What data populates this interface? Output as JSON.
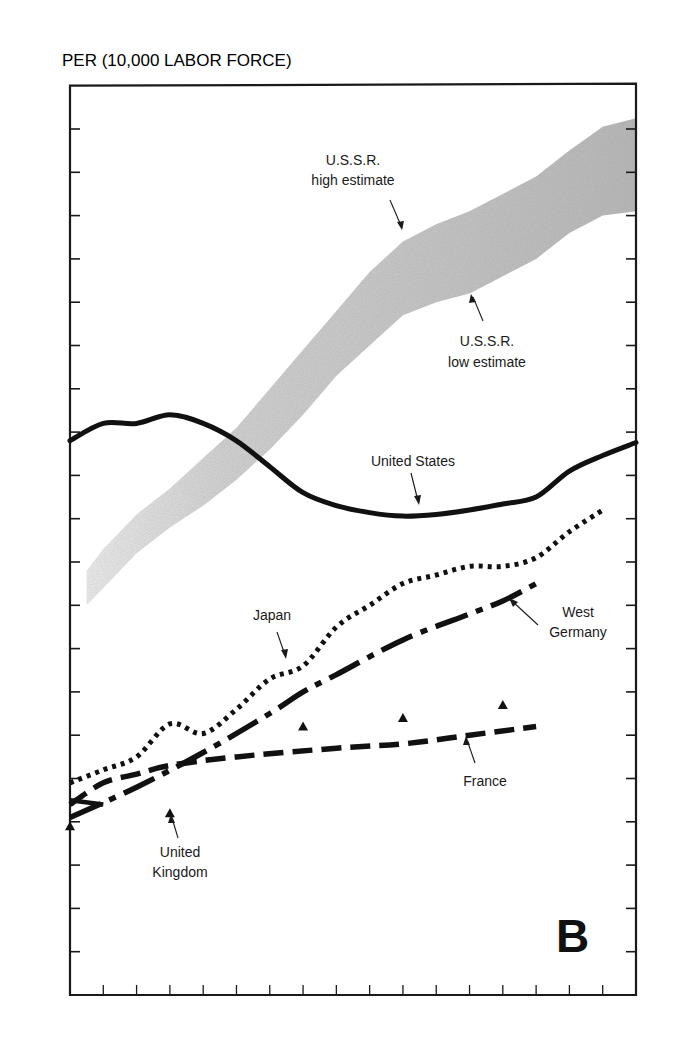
{
  "chart_data": {
    "type": "line",
    "title": "",
    "panel_label": "B",
    "ylabel": "PER (10,000 LABOR FORCE)",
    "xlabel": "",
    "x_range": [
      1965,
      1982
    ],
    "ylim": [
      0,
      110
    ],
    "grid": false,
    "legend": "none (direct labels)",
    "y_ticks": [
      {
        "value": 0,
        "label": "0"
      },
      {
        "value": 5,
        "label": "5"
      },
      {
        "value": 10,
        "label": "10"
      },
      {
        "value": 15,
        "label": "15"
      },
      {
        "value": 20,
        "label": "20"
      },
      {
        "value": 25,
        "label": "25"
      },
      {
        "value": 30,
        "label": "30"
      },
      {
        "value": 35,
        "label": "35"
      },
      {
        "value": 40,
        "label": "40"
      },
      {
        "value": 45,
        "label": "45"
      },
      {
        "value": 50,
        "label": "50"
      },
      {
        "value": 55,
        "label": "55"
      },
      {
        "value": 60,
        "label": "60"
      },
      {
        "value": 65,
        "label": "65"
      },
      {
        "value": 70,
        "label": "70"
      },
      {
        "value": 75,
        "label": "75"
      },
      {
        "value": 80,
        "label": "80"
      },
      {
        "value": 85,
        "label": "85"
      },
      {
        "value": 90,
        "label": "90"
      },
      {
        "value": 95,
        "label": "95"
      },
      {
        "value": 100,
        "label": "100"
      },
      {
        "value": 110,
        "label": "110"
      }
    ],
    "x_ticks": [
      1966,
      1967,
      1968,
      1969,
      1970,
      1971,
      1972,
      1973,
      1974,
      1975,
      1976,
      1977,
      1978,
      1979,
      1980,
      1981
    ],
    "x_tick_labels": [
      {
        "year": 1965,
        "label": "1965"
      },
      {
        "year": 1967,
        "label": "67"
      },
      {
        "year": 1969,
        "label": "69"
      },
      {
        "year": 1971,
        "label": "71"
      },
      {
        "year": 1973,
        "label": "73"
      },
      {
        "year": 1975,
        "label": "75"
      },
      {
        "year": 1977,
        "label": "77"
      },
      {
        "year": 1979,
        "label": "79"
      },
      {
        "year": 1981.5,
        "label": "81·82"
      }
    ],
    "band": {
      "name": "U.S.S.R.",
      "x": [
        1965.5,
        1966,
        1967,
        1968,
        1969,
        1970,
        1971,
        1972,
        1973,
        1974,
        1975,
        1976,
        1977,
        1978,
        1979,
        1980,
        1981,
        1982
      ],
      "high": [
        49,
        51.5,
        55.5,
        58.5,
        62,
        65.5,
        70,
        74.5,
        79,
        83.5,
        87,
        89,
        90.5,
        92.5,
        94.5,
        97.5,
        100.5,
        102.5
      ],
      "low": [
        45,
        47,
        51,
        54,
        56.5,
        59.5,
        63,
        67,
        71.5,
        75,
        78.5,
        80,
        81,
        83,
        85,
        88,
        90,
        90.5
      ],
      "color": "#b8b8b8"
    },
    "series": [
      {
        "name": "United States",
        "style": "solid",
        "x": [
          1965,
          1966,
          1967,
          1968,
          1969,
          1970,
          1971,
          1972,
          1973,
          1974,
          1975,
          1976,
          1977,
          1978,
          1979,
          1980,
          1981,
          1982
        ],
        "values": [
          64,
          66,
          66,
          67,
          66,
          64,
          61,
          58,
          56.5,
          55.7,
          55.3,
          55.5,
          56,
          56.7,
          57.5,
          60.5,
          62.3,
          63.8
        ]
      },
      {
        "name": "Japan",
        "style": "dotted",
        "x": [
          1965,
          1966,
          1967,
          1968,
          1969,
          1970,
          1971,
          1972,
          1973,
          1974,
          1975,
          1976,
          1977,
          1978,
          1979,
          1980,
          1981
        ],
        "values": [
          24.5,
          26,
          27.5,
          31.3,
          30.2,
          33,
          36.5,
          38,
          42.5,
          45,
          47.5,
          48.5,
          49.5,
          49.5,
          50.5,
          53.5,
          56
        ]
      },
      {
        "name": "West Germany",
        "style": "dash-dot",
        "x": [
          1965,
          1967,
          1969,
          1971,
          1972,
          1973,
          1975,
          1977,
          1978,
          1979
        ],
        "values": [
          20.5,
          24,
          28,
          32.5,
          35,
          37,
          41,
          44,
          45.5,
          47.5
        ]
      },
      {
        "name": "France",
        "style": "dashed",
        "x": [
          1965,
          1966,
          1967,
          1968,
          1970,
          1973,
          1975,
          1977,
          1979
        ],
        "values": [
          22,
          24.5,
          25.5,
          26.5,
          27.5,
          28.5,
          29,
          30,
          31
        ]
      },
      {
        "name": "United Kingdom",
        "style": "solid-short",
        "x": [
          1965,
          1966
        ],
        "values": [
          22.5,
          22
        ]
      }
    ],
    "markers": {
      "name": "United Kingdom",
      "symbol": "triangle",
      "x": [
        1965,
        1968,
        1972,
        1975,
        1978
      ],
      "values": [
        19.5,
        21,
        31,
        32,
        33.5
      ]
    },
    "annotations": [
      {
        "id": "ussr-high",
        "lines": [
          "U.S.S.R.",
          "high estimate"
        ]
      },
      {
        "id": "ussr-low",
        "lines": [
          "U.S.S.R.",
          "low estimate"
        ]
      },
      {
        "id": "us",
        "lines": [
          "United States"
        ]
      },
      {
        "id": "japan",
        "lines": [
          "Japan"
        ]
      },
      {
        "id": "west-germany",
        "lines": [
          "West",
          "Germany"
        ]
      },
      {
        "id": "france",
        "lines": [
          "France"
        ]
      },
      {
        "id": "uk",
        "lines": [
          "United",
          "Kingdom"
        ]
      }
    ]
  }
}
